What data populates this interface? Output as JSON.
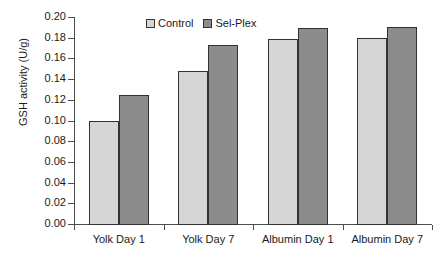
{
  "chart_data": {
    "type": "bar",
    "title": "",
    "subtitle": "",
    "xlabel": "",
    "ylabel": "GSH activity (U/g)",
    "categories": [
      "Yolk Day 1",
      "Yolk Day 7",
      "Albumin Day 1",
      "Albumin Day 7"
    ],
    "series": [
      {
        "name": "Control",
        "color": "#d6d6d6",
        "values": [
          0.1,
          0.148,
          0.179,
          0.18
        ]
      },
      {
        "name": "Sel-Plex",
        "color": "#8c8c8c",
        "values": [
          0.125,
          0.173,
          0.189,
          0.19
        ]
      }
    ],
    "ylim": [
      0.0,
      0.2
    ],
    "ytick_step": 0.02,
    "ytick_labels": [
      "0.00",
      "0.02",
      "0.04",
      "0.06",
      "0.08",
      "0.10",
      "0.12",
      "0.14",
      "0.16",
      "0.18",
      "0.20"
    ],
    "ytick_values": [
      0.0,
      0.02,
      0.04,
      0.06,
      0.08,
      0.1,
      0.12,
      0.14,
      0.16,
      0.18,
      0.2
    ],
    "grid": false,
    "legend_position": "top-center",
    "legend_entries": [
      "Control",
      "Sel-Plex"
    ]
  }
}
